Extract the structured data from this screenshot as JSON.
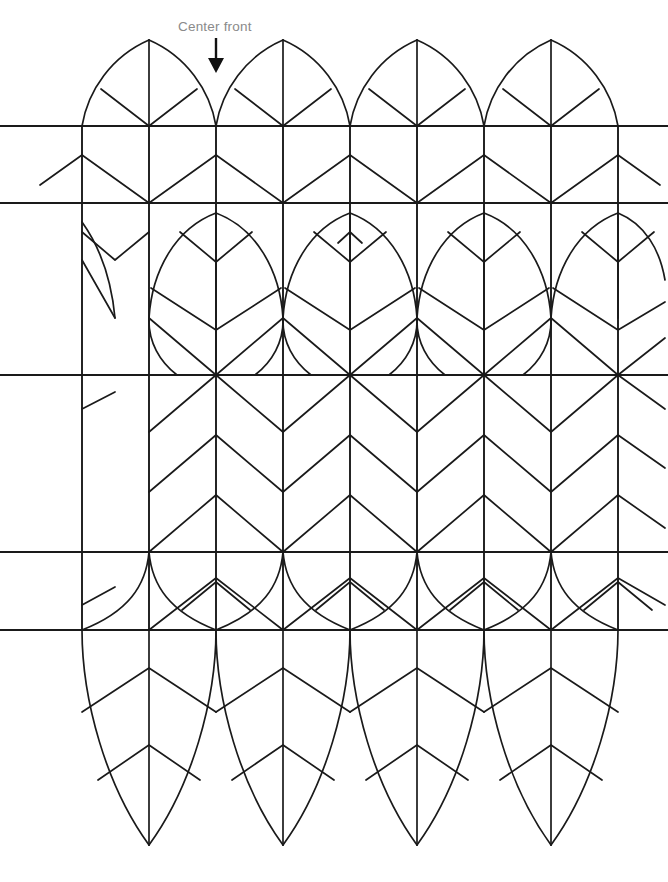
{
  "diagram": {
    "type": "quilting-smocking-pattern",
    "canvas": {
      "width": 668,
      "height": 882,
      "background": "#ffffff"
    },
    "stroke": {
      "color": "#1a1a1a",
      "grid_width": 1.9,
      "motif_width": 1.7
    },
    "annotations": [
      {
        "id": "center-front",
        "label": "Center front",
        "text_x": 178,
        "text_y": 31,
        "color": "#8a8a8a",
        "arrow": {
          "x": 216,
          "y_start": 38,
          "y_end": 72,
          "color": "#111111"
        }
      }
    ],
    "grid": {
      "vertical_lines_x": [
        82,
        149,
        216,
        283,
        350,
        417,
        484,
        551,
        618
      ],
      "horizontal_lines_y": [
        126,
        203,
        375,
        552,
        630
      ],
      "horizontal_extent": {
        "x_start": 0,
        "x_end": 668
      },
      "vertical_extent": {
        "y_start": 126,
        "y_end": 630
      },
      "column_spacing": 67,
      "petal_width": 134,
      "petal_centers_x": [
        149,
        283,
        417,
        551
      ],
      "petal_offset_centers_x": [
        82,
        216,
        350,
        484,
        618
      ]
    },
    "bands": [
      {
        "id": "band-top-petals",
        "y_top": 40,
        "y_bottom": 126,
        "motif": "upright-petal-tips"
      },
      {
        "id": "band-upper-chev",
        "y_top": 126,
        "y_bottom": 203,
        "motif": "chevron-down"
      },
      {
        "id": "band-mid-petals",
        "y_top": 203,
        "y_bottom": 375,
        "motif": "petal-with-chevrons"
      },
      {
        "id": "band-center-chev",
        "y_top": 375,
        "y_bottom": 552,
        "motif": "chevron-down-stack"
      },
      {
        "id": "band-lower-chev",
        "y_top": 552,
        "y_bottom": 630,
        "motif": "chevron-up"
      },
      {
        "id": "band-bottom-petals",
        "y_top": 630,
        "y_bottom": 845,
        "motif": "inverted-petals"
      }
    ],
    "legend": {
      "line_kinds": [
        "grid line",
        "petal outline curve",
        "chevron fold line",
        "center stem line"
      ]
    }
  }
}
